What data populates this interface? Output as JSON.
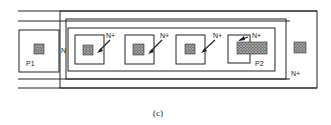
{
  "figure": {
    "caption": "(c)",
    "labels": {
      "p1": "P1",
      "n": "N",
      "nplus_1": "N+",
      "nplus_2": "N+",
      "nplus_3": "N+",
      "nplus_4": "N+",
      "p2": "P2",
      "nplus_outer": "N+"
    },
    "colors": {
      "line": "#222222",
      "contact_fill": "#555555",
      "background": "#ffffff"
    }
  }
}
